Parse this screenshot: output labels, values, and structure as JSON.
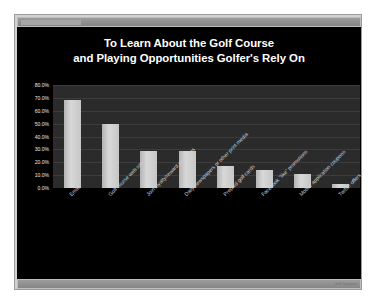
{
  "slide": {
    "footer_credit": "Golf Datatech",
    "background_color": "#000000",
    "frame_color": "#d2d2d2",
    "chrome_color": "#8c8c8c"
  },
  "chart_data": {
    "type": "bar",
    "title": "To Learn About the Golf Course and Playing Opportunities Golfer's Rely On",
    "title_lines": [
      "To Learn About the Golf Course",
      "and Playing Opportunities Golfer's Rely On"
    ],
    "xlabel": "",
    "ylabel": "",
    "ylim": [
      0,
      80
    ],
    "grid": true,
    "legend": false,
    "bar_color": "#c8c8c8",
    "plot_background": "#2b2b2b",
    "y_ticks": [
      "80.0%",
      "70.0%",
      "60.0%",
      "50.0%",
      "40.0%",
      "30.0%",
      "20.0%",
      "10.0%",
      "0.0%"
    ],
    "y_tick_values": [
      80,
      70,
      60,
      50,
      40,
      30,
      20,
      10,
      0
    ],
    "categories": [
      "Email",
      "Golf course web site",
      "Join loyalty/reward programs",
      "Daily newspapers or other print media",
      "Prepaid golf cards",
      "Facebook \"like\" promotions",
      "Mobile application coupons",
      "Twitter offers"
    ],
    "values": [
      68,
      50,
      29,
      29,
      17,
      14,
      11,
      3
    ],
    "value_labels": [
      "68.0%",
      "50.0%",
      "29.0%",
      "29.0%",
      "17.0%",
      "14.0%",
      "11.0%",
      "3.0%"
    ]
  }
}
